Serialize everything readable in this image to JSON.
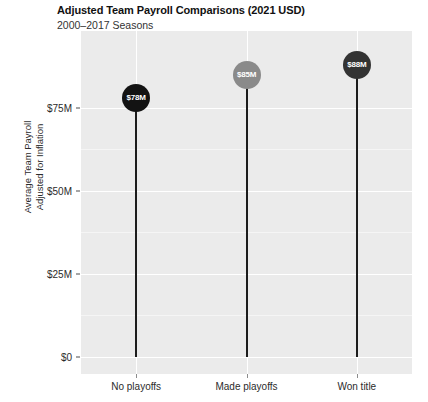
{
  "chart_data": {
    "type": "bar",
    "subtype": "lollipop",
    "title": "Adjusted Team Payroll Comparisons (2021 USD)",
    "subtitle": "2000–2017 Seasons",
    "xlabel": "",
    "ylabel": "Average Team Payroll\nAdjusted for Inflation",
    "categories": [
      "No playoffs",
      "Made playoffs",
      "Won title"
    ],
    "values": [
      78,
      85,
      88
    ],
    "value_labels": [
      "$78M",
      "$85M",
      "$88M"
    ],
    "point_colors": [
      "#131313",
      "#8a8a8a",
      "#333333"
    ],
    "ylim": [
      0,
      96
    ],
    "ytick_values": [
      0,
      25,
      50,
      75
    ],
    "ytick_labels": [
      "$0",
      "$25M",
      "$50M",
      "$75M"
    ],
    "units": "millions of 2021 USD",
    "grid": true,
    "legend": "none",
    "panel_background": "#ebebeb",
    "gridline_color": "#ffffff",
    "stem_color": "#1c1c1c"
  }
}
